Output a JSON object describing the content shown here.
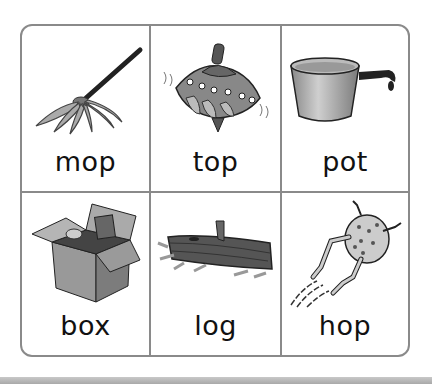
{
  "worksheet": {
    "title": "Short o word picture cards",
    "cards": [
      {
        "word": "mop",
        "picture": "mop-icon"
      },
      {
        "word": "top",
        "picture": "spinning-top-icon"
      },
      {
        "word": "pot",
        "picture": "cooking-pot-icon"
      },
      {
        "word": "box",
        "picture": "cardboard-box-icon"
      },
      {
        "word": "log",
        "picture": "log-icon"
      },
      {
        "word": "hop",
        "picture": "hopping-frog-icon"
      }
    ]
  },
  "colors": {
    "border": "#8a8a8a",
    "text": "#111111",
    "background": "#ffffff",
    "bottom_bar": "#b0b0b0"
  }
}
